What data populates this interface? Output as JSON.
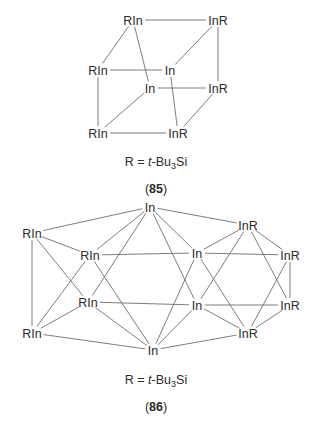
{
  "structures": [
    {
      "id": "85",
      "compound_number": "85",
      "substituent_definition": {
        "R": "R",
        "equals": " = ",
        "prefix": "t",
        "dash": "-Bu",
        "sub": "3",
        "suffix": "Si"
      },
      "nodes": [
        {
          "key": "tbl",
          "label": "RIn",
          "x": 133,
          "y": 20
        },
        {
          "key": "tbr",
          "label": "InR",
          "x": 218,
          "y": 20
        },
        {
          "key": "ftl",
          "label": "RIn",
          "x": 98,
          "y": 70
        },
        {
          "key": "ftr",
          "label": "In",
          "x": 170,
          "y": 70
        },
        {
          "key": "bbl",
          "label": "In",
          "x": 150,
          "y": 88
        },
        {
          "key": "bbr",
          "label": "InR",
          "x": 218,
          "y": 88
        },
        {
          "key": "fbl",
          "label": "RIn",
          "x": 98,
          "y": 133
        },
        {
          "key": "fbr",
          "label": "InR",
          "x": 178,
          "y": 133
        }
      ],
      "edges": [
        [
          "tbl",
          "tbr"
        ],
        [
          "tbl",
          "ftl"
        ],
        [
          "tbl",
          "bbl"
        ],
        [
          "tbr",
          "ftr"
        ],
        [
          "tbr",
          "bbr"
        ],
        [
          "ftl",
          "ftr"
        ],
        [
          "ftl",
          "fbl"
        ],
        [
          "ftr",
          "fbr"
        ],
        [
          "bbl",
          "bbr"
        ],
        [
          "bbl",
          "fbl"
        ],
        [
          "bbr",
          "fbr"
        ],
        [
          "fbl",
          "fbr"
        ]
      ]
    },
    {
      "id": "86",
      "compound_number": "86",
      "substituent_definition": {
        "R": "R",
        "equals": " = ",
        "prefix": "t",
        "dash": "-Bu",
        "sub": "3",
        "suffix": "Si"
      },
      "nodes": [
        {
          "key": "T",
          "label": "In",
          "x": 150,
          "y": 207
        },
        {
          "key": "L1",
          "label": "RIn",
          "x": 32,
          "y": 233
        },
        {
          "key": "A",
          "label": "RIn",
          "x": 90,
          "y": 255
        },
        {
          "key": "C",
          "label": "In",
          "x": 197,
          "y": 253
        },
        {
          "key": "E",
          "label": "InR",
          "x": 248,
          "y": 225
        },
        {
          "key": "G",
          "label": "InR",
          "x": 290,
          "y": 255
        },
        {
          "key": "B",
          "label": "RIn",
          "x": 88,
          "y": 302
        },
        {
          "key": "D",
          "label": "In",
          "x": 197,
          "y": 305
        },
        {
          "key": "H",
          "label": "InR",
          "x": 290,
          "y": 305
        },
        {
          "key": "L2",
          "label": "RIn",
          "x": 32,
          "y": 333
        },
        {
          "key": "Bo",
          "label": "In",
          "x": 153,
          "y": 350
        },
        {
          "key": "F",
          "label": "InR",
          "x": 248,
          "y": 333
        }
      ],
      "edges": [
        [
          "T",
          "L1"
        ],
        [
          "T",
          "A"
        ],
        [
          "T",
          "B"
        ],
        [
          "T",
          "C"
        ],
        [
          "T",
          "D"
        ],
        [
          "T",
          "E"
        ],
        [
          "Bo",
          "L2"
        ],
        [
          "Bo",
          "A"
        ],
        [
          "Bo",
          "B"
        ],
        [
          "Bo",
          "C"
        ],
        [
          "Bo",
          "D"
        ],
        [
          "Bo",
          "F"
        ],
        [
          "L1",
          "A"
        ],
        [
          "L1",
          "B"
        ],
        [
          "L1",
          "L2"
        ],
        [
          "L2",
          "A"
        ],
        [
          "L2",
          "B"
        ],
        [
          "A",
          "C"
        ],
        [
          "B",
          "D"
        ],
        [
          "C",
          "E"
        ],
        [
          "C",
          "G"
        ],
        [
          "C",
          "F"
        ],
        [
          "D",
          "E"
        ],
        [
          "D",
          "H"
        ],
        [
          "D",
          "F"
        ],
        [
          "E",
          "G"
        ],
        [
          "E",
          "H"
        ],
        [
          "G",
          "H"
        ],
        [
          "G",
          "F"
        ],
        [
          "H",
          "F"
        ]
      ]
    }
  ],
  "captions": {
    "s85": {
      "definition_y": 166,
      "number_y": 192
    },
    "s86": {
      "definition_y": 383,
      "number_y": 410
    }
  }
}
